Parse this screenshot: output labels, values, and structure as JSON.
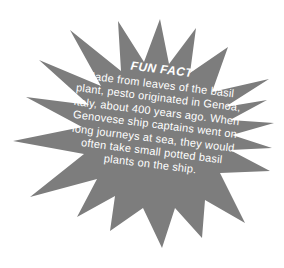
{
  "background_color": "#ffffff",
  "burst": {
    "shape": "starburst",
    "color": "#7d7d7d",
    "text_color": "#ffffff",
    "title": "FUN FACT",
    "body_lines": [
      "Made from leaves of the basil",
      "plant, pesto originated in Genoa,",
      "Italy, about 400 years ago. When",
      "Genovese ship captains went on",
      "long journeys at sea, they would",
      "often take small potted basil",
      "plants on the ship."
    ]
  }
}
